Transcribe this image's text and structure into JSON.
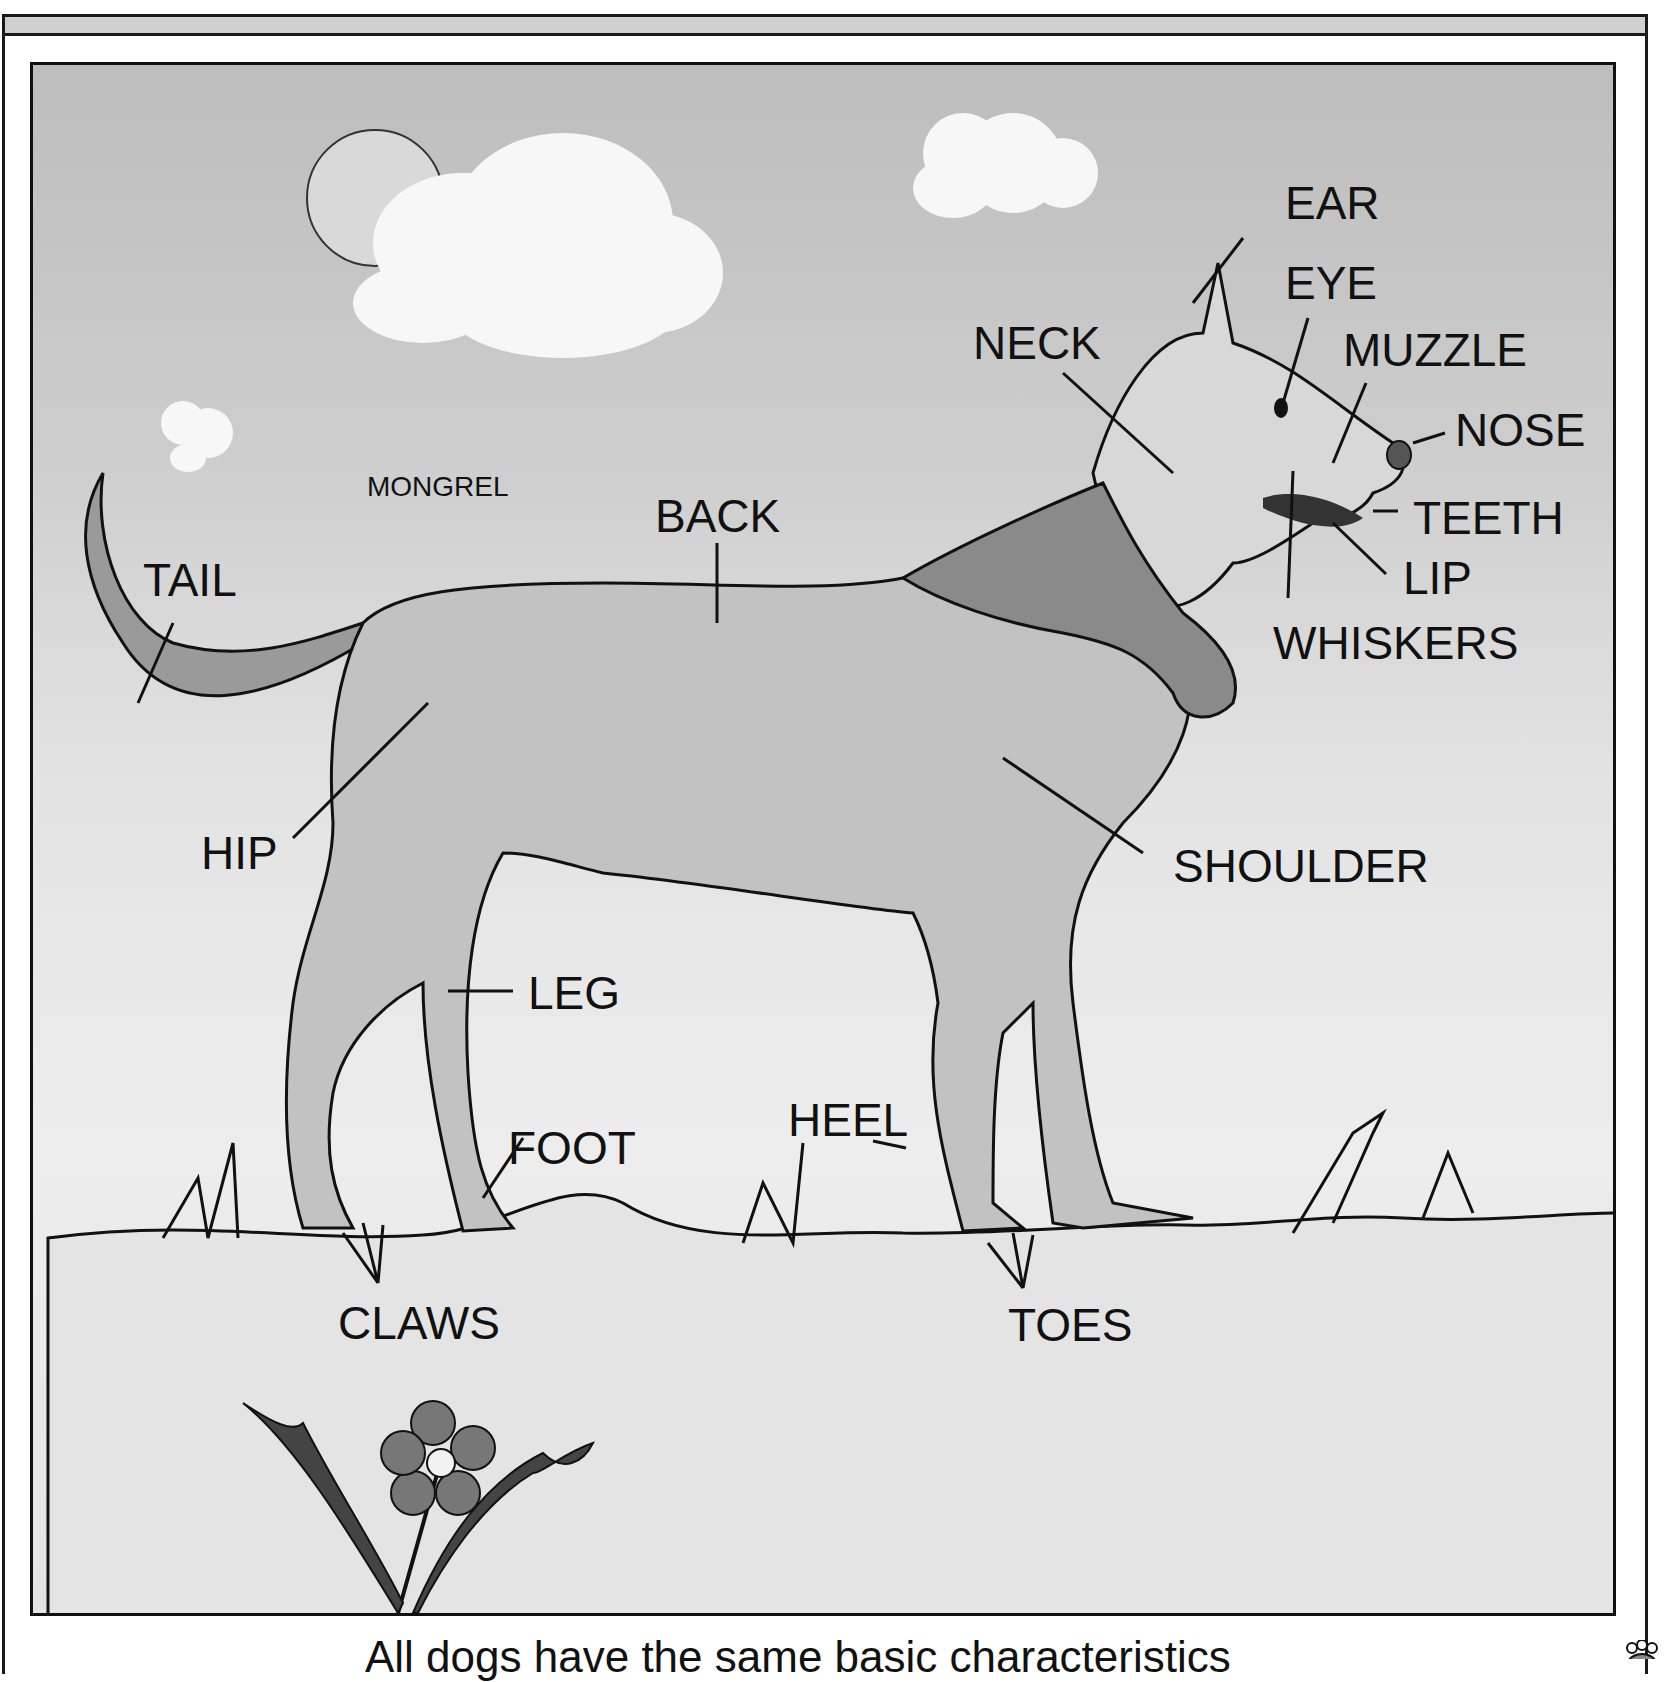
{
  "title_label": "MONGREL",
  "labels": {
    "ear": "EAR",
    "eye": "EYE",
    "neck": "NECK",
    "muzzle": "MUZZLE",
    "nose": "NOSE",
    "teeth": "TEETH",
    "lip": "LIP",
    "whiskers": "WHISKERS",
    "back": "BACK",
    "tail": "TAIL",
    "hip": "HIP",
    "shoulder": "SHOULDER",
    "leg": "LEG",
    "heel": "HEEL",
    "foot": "FOOT",
    "claws": "CLAWS",
    "toes": "TOES"
  },
  "caption": "All dogs have the same basic characteristics",
  "icons": {
    "paw": "paw-print-icon"
  }
}
